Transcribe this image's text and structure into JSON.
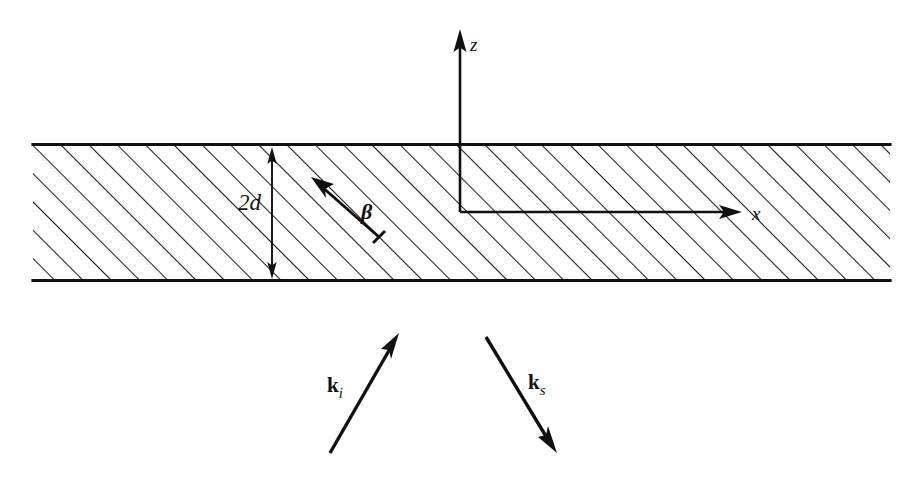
{
  "figure": {
    "background_color": "#ffffff",
    "ink_color": "#101010",
    "width": 919,
    "height": 479
  },
  "axes": {
    "z": {
      "label": "z",
      "style": "italic",
      "description": "vertical axis pointing up",
      "label_x": 470,
      "label_y": 50,
      "origin_x": 460,
      "origin_y": 212,
      "tip_x": 460,
      "tip_y": 30
    },
    "x": {
      "label": "x",
      "style": "italic",
      "description": "horizontal axis pointing right",
      "label_x": 752,
      "label_y": 219,
      "origin_x": 460,
      "origin_y": 212,
      "tip_x": 741,
      "tip_y": 212
    }
  },
  "slab": {
    "name": "hatched-slab",
    "fill_pattern": "diagonal-hatch",
    "hatch_angle_degrees": 45,
    "hatch_spacing_px": 20,
    "top_y": 144,
    "bottom_y": 281,
    "left_x": 33,
    "right_x": 890
  },
  "dimension": {
    "label": "2d",
    "style": "italic",
    "description": "slab thickness measured between the two slab faces",
    "line_x": 272,
    "top_y": 150,
    "bottom_y": 276,
    "label_x": 238,
    "label_y": 207
  },
  "vectors": [
    {
      "id": "beta",
      "label": "β",
      "style": "bold-italic",
      "description": "beta direction vector inside the slab, pointing up-left",
      "tail_x": 378,
      "tail_y": 236,
      "head_x": 312,
      "head_y": 178,
      "label_x": 362,
      "label_y": 217
    },
    {
      "id": "k_i",
      "label": "k",
      "subscript": "i",
      "style": "bold",
      "description": "incident wave vector, pointing up-right toward the slab",
      "tail_x": 330,
      "tail_y": 452,
      "head_x": 398,
      "head_y": 334,
      "label_x": 327,
      "label_y": 392
    },
    {
      "id": "k_s",
      "label": "k",
      "subscript": "s",
      "style": "bold",
      "description": "scattered wave vector, pointing down-right away from the slab",
      "tail_x": 486,
      "tail_y": 337,
      "head_x": 556,
      "head_y": 452,
      "label_x": 528,
      "label_y": 389
    }
  ]
}
